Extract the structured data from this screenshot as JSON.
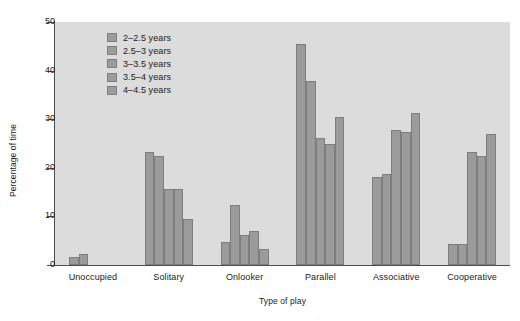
{
  "chart_data": {
    "type": "bar",
    "title": "",
    "xlabel": "Type of play",
    "ylabel": "Percentage of time",
    "categories": [
      "Unoccupied",
      "Solitary",
      "Onlooker",
      "Parallel",
      "Associative",
      "Cooperative"
    ],
    "ylim": [
      0,
      50
    ],
    "yticks": [
      0,
      10,
      20,
      30,
      40,
      50
    ],
    "ytick_labels": [
      "0",
      "10",
      "20",
      "30",
      "40",
      "50"
    ],
    "grid": false,
    "legend_position": "upper-left-inside",
    "bar_color": "#9b9b9b",
    "bar_edge_color": "#7d7d7d",
    "plot_background": "#dcdcdc",
    "figure_background": "#ffffff",
    "axis_color": "#4d4d4d",
    "series": [
      {
        "name": "2–2.5 years",
        "values": [
          1.7,
          23.3,
          4.8,
          45.5,
          18.2,
          4.3
        ]
      },
      {
        "name": "2.5–3 years",
        "values": [
          2.3,
          22.5,
          12.3,
          37.8,
          18.7,
          4.3
        ]
      },
      {
        "name": "3–3.5 years",
        "values": [
          0,
          15.7,
          6.1,
          26.2,
          27.7,
          23.3
        ]
      },
      {
        "name": "3.5–4 years",
        "values": [
          0,
          15.7,
          7.0,
          24.8,
          27.3,
          22.4
        ]
      },
      {
        "name": "4–4.5 years",
        "values": [
          0,
          9.5,
          3.2,
          30.5,
          31.3,
          26.9
        ]
      }
    ]
  }
}
